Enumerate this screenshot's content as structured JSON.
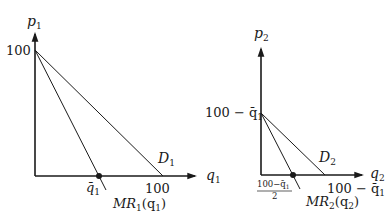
{
  "colors": {
    "ink": "#1a1a1a",
    "background": "#ffffff"
  },
  "left_panel": {
    "y_axis_label": "p",
    "y_axis_sub": "1",
    "x_axis_label": "q",
    "x_axis_sub": "1",
    "y_intercept_label": "100",
    "x_intercept_label": "100",
    "qbar_label": "q̄",
    "qbar_sub": "1",
    "demand_label": "D",
    "demand_sub": "1",
    "mr_label": "MR",
    "mr_sub": "1",
    "mr_arg_open": "(q",
    "mr_arg_sub": "1",
    "mr_arg_close": ")"
  },
  "right_panel": {
    "y_axis_label": "p",
    "y_axis_sub": "2",
    "x_axis_label": "q",
    "x_axis_sub": "2",
    "y_intercept_label": "100 − q̄",
    "y_intercept_sub": "1",
    "x_intercept_label": "100 − q̄",
    "x_intercept_sub": "1",
    "mr_zero_numerator": "100−q̄",
    "mr_zero_numerator_sub": "1",
    "mr_zero_denominator": "2",
    "demand_label": "D",
    "demand_sub": "2",
    "mr_label": "MR",
    "mr_sub": "2",
    "mr_arg_open": "(q",
    "mr_arg_sub": "2",
    "mr_arg_close": ")"
  }
}
